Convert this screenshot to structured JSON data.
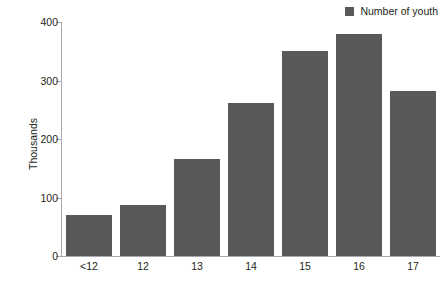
{
  "chart_data": {
    "type": "bar",
    "title": "",
    "subtitle": "",
    "xlabel": "",
    "ylabel": "Thousands",
    "categories": [
      "<12",
      "12",
      "13",
      "14",
      "15",
      "16",
      "17"
    ],
    "values": [
      70,
      88,
      165,
      262,
      350,
      380,
      282
    ],
    "series": [
      {
        "name": "Number of youth",
        "values": [
          70,
          88,
          165,
          262,
          350,
          380,
          282
        ],
        "color": "#58595b"
      }
    ],
    "ylim": [
      0,
      400
    ],
    "ytick_values": [
      0,
      100,
      200,
      300,
      400
    ],
    "ytick_labels": [
      "0",
      "100",
      "200",
      "300",
      "400"
    ],
    "grid": false,
    "legend": {
      "position": "top-right",
      "entries": [
        {
          "label": "Number of youth",
          "color": "#58595b",
          "marker": "square"
        }
      ]
    },
    "annotations": []
  },
  "legend": {
    "label": "Number of youth"
  },
  "axis": {
    "y_title": "Thousands"
  },
  "colors": {
    "bar": "#58595b",
    "axis": "#a7a9ac",
    "text": "#231f20",
    "background": "#ffffff"
  }
}
